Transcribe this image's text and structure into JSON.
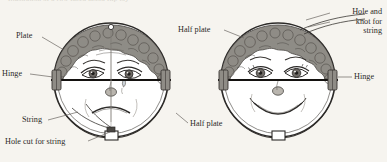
{
  "figure": {
    "clipped_caption": "Illustration of a two-faced mood flip toy",
    "background_color": "#f6f4ef",
    "ink_color": "#2c2a28",
    "hair_color": "#8d8a84",
    "plate_fill": "#ffffff"
  },
  "labels": {
    "plate": "Plate",
    "hinge_left": "Hinge",
    "string": "String",
    "hole_cut_for_string": "Hole cut for string",
    "half_plate_bottom": "Half plate",
    "half_plate_top": "Half plate",
    "hole_and_knot_for_string": "Hole and\nknot for\nstring",
    "hole_and_knot_line1": "Hole and",
    "hole_and_knot_line2": "knot for",
    "hole_and_knot_line3": "string",
    "hinge_right": "Hinge"
  },
  "left_figure": {
    "name": "sad-face-plate",
    "expression": "sad",
    "has_tear": true,
    "center_x": 111,
    "center_y": 80,
    "radius": 57
  },
  "right_figure": {
    "name": "happy-face-plate",
    "expression": "happy",
    "has_tear": false,
    "center_x": 278,
    "center_y": 80,
    "radius": 57
  }
}
